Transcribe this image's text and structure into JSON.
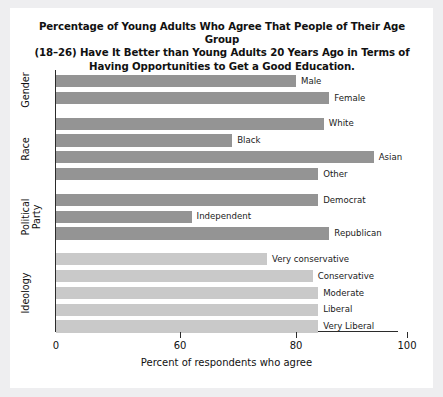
{
  "chart_data": {
    "type": "bar",
    "orientation": "horizontal",
    "title": "Percentage of Young Adults Who Agree That People of Their Age Group (18–26) Have It Better than Young Adults 20 Years Ago in Terms of Having Opportunities to Get a Good Education.",
    "title_lines": [
      "Percentage of Young Adults Who Agree That People of Their Age Group",
      "(18–26) Have It Better than Young Adults 20 Years Ago in Terms of",
      "Having Opportunities to Get a Good Education."
    ],
    "xlabel": "Percent of respondents who agree",
    "ylabel": "",
    "xticks": [
      0,
      60,
      80,
      100
    ],
    "xtick_labels": [
      "0",
      "60",
      "80",
      "100"
    ],
    "xlim": [
      0,
      100
    ],
    "axis_note": "broken axis: 0 to 60 compressed",
    "grid": false,
    "legend": false,
    "categories": [
      "Male",
      "Female",
      "White",
      "Black",
      "Asian",
      "Other",
      "Democrat",
      "Independent",
      "Republican",
      "Very conservative",
      "Conservative",
      "Moderate",
      "Liberal",
      "Very Liberal"
    ],
    "values": [
      80,
      86,
      85,
      69,
      94,
      84,
      84,
      62,
      86,
      75,
      83,
      84,
      84,
      84
    ],
    "groups": [
      {
        "name": "Gender",
        "label_lines": [
          "Gender"
        ],
        "color": "#949494",
        "items": [
          {
            "label": "Male",
            "value": 80
          },
          {
            "label": "Female",
            "value": 86
          }
        ]
      },
      {
        "name": "Race",
        "label_lines": [
          "Race"
        ],
        "color": "#949494",
        "items": [
          {
            "label": "White",
            "value": 85
          },
          {
            "label": "Black",
            "value": 69
          },
          {
            "label": "Asian",
            "value": 94
          },
          {
            "label": "Other",
            "value": 84
          }
        ]
      },
      {
        "name": "Political Party",
        "label_lines": [
          "Political",
          "Party"
        ],
        "color": "#949494",
        "items": [
          {
            "label": "Democrat",
            "value": 84
          },
          {
            "label": "Independent",
            "value": 62
          },
          {
            "label": "Republican",
            "value": 86
          }
        ]
      },
      {
        "name": "Ideology",
        "label_lines": [
          "Ideology"
        ],
        "color": "#c9c9c9",
        "items": [
          {
            "label": "Very conservative",
            "value": 75
          },
          {
            "label": "Conservative",
            "value": 83
          },
          {
            "label": "Moderate",
            "value": 84
          },
          {
            "label": "Liberal",
            "value": 84
          },
          {
            "label": "Very Liberal",
            "value": 84
          }
        ]
      }
    ],
    "colors": {
      "bar_dark": "#949494",
      "bar_light": "#c9c9c9",
      "axis": "#2b2b2b",
      "text": "#111111",
      "card_background": "#ffffff",
      "page_background": "#eeeef0"
    }
  }
}
